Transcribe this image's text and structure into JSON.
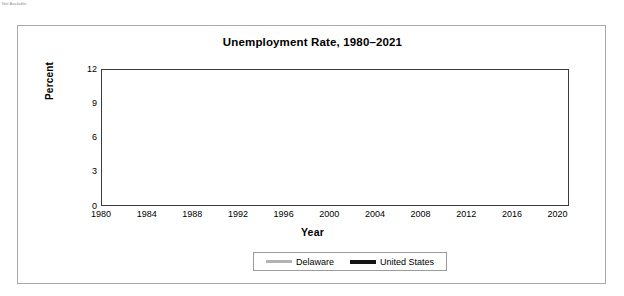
{
  "header_fragment": "Not Available",
  "card": {
    "border_color": "#a9a9a9"
  },
  "chart_data": {
    "type": "line",
    "title": "Unemployment Rate, 1980–2021",
    "xlabel": "Year",
    "ylabel": "Percent",
    "xlim": [
      1980,
      2021
    ],
    "ylim": [
      0,
      12
    ],
    "yticks": [
      0,
      3,
      6,
      9,
      12
    ],
    "ytick_labels": [
      "0",
      "3",
      "6",
      "9",
      "12"
    ],
    "xticks": [
      1980,
      1984,
      1988,
      1992,
      1996,
      2000,
      2004,
      2008,
      2012,
      2016,
      2020
    ],
    "xtick_labels": [
      "1980",
      "1984",
      "1988",
      "1992",
      "1996",
      "2000",
      "2004",
      "2008",
      "2012",
      "2016",
      "2020"
    ],
    "xtick_minor_step": 1,
    "grid": "horizontal",
    "grid_color": "#c0c0c0",
    "legend_position": "bottom-center",
    "x": [
      1980,
      1981,
      1982,
      1983,
      1984,
      1985,
      1986,
      1987,
      1988,
      1989,
      1990,
      1991,
      1992,
      1993,
      1994,
      1995,
      1996,
      1997,
      1998,
      1999,
      2000,
      2001,
      2002,
      2003,
      2004,
      2005,
      2006,
      2007,
      2008,
      2009,
      2010,
      2011,
      2012,
      2013,
      2014,
      2015,
      2016,
      2017,
      2018,
      2019,
      2020,
      2021
    ],
    "series": [
      {
        "name": "Delaware",
        "color": "#b3b3b3",
        "line_width": 2.6,
        "values": [
          7.5,
          7.8,
          8.0,
          7.3,
          6.2,
          5.1,
          4.3,
          3.6,
          3.2,
          2.9,
          3.0,
          4.6,
          5.6,
          5.1,
          4.9,
          4.6,
          4.4,
          4.2,
          3.9,
          3.6,
          3.4,
          3.5,
          4.1,
          4.1,
          3.9,
          4.0,
          3.5,
          3.3,
          5.1,
          8.4,
          9.1,
          8.6,
          7.6,
          6.8,
          5.9,
          5.0,
          4.6,
          4.7,
          4.0,
          3.7,
          null,
          null
        ]
      },
      {
        "name": "United States",
        "color": "#141414",
        "line_width": 2.8,
        "values": [
          7.1,
          7.6,
          9.7,
          9.6,
          7.5,
          7.2,
          7.0,
          6.2,
          5.5,
          5.3,
          5.6,
          6.8,
          7.5,
          6.9,
          6.1,
          5.6,
          5.4,
          4.9,
          4.5,
          4.2,
          4.0,
          4.7,
          5.8,
          6.0,
          5.5,
          5.1,
          4.6,
          4.6,
          5.8,
          9.3,
          10.7,
          8.9,
          8.1,
          7.4,
          6.2,
          5.3,
          4.9,
          4.4,
          3.9,
          3.6,
          8.1,
          5.2
        ]
      }
    ]
  }
}
